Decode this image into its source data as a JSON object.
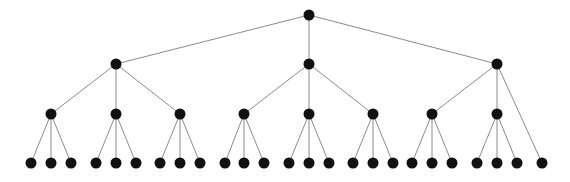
{
  "diagram": {
    "type": "tree",
    "width": 570,
    "height": 182,
    "colors": {
      "node": "#111111",
      "edge": "#8a8a8a",
      "background": "#ffffff"
    },
    "node_radius": 5.5,
    "nodes": [
      {
        "id": "r",
        "x": 309,
        "y": 15,
        "level": 0
      },
      {
        "id": "a",
        "x": 116,
        "y": 64,
        "level": 1,
        "parent": "r"
      },
      {
        "id": "b",
        "x": 309,
        "y": 64,
        "level": 1,
        "parent": "r"
      },
      {
        "id": "c",
        "x": 497,
        "y": 64,
        "level": 1,
        "parent": "r"
      },
      {
        "id": "a1",
        "x": 51,
        "y": 114,
        "level": 2,
        "parent": "a"
      },
      {
        "id": "a2",
        "x": 116,
        "y": 114,
        "level": 2,
        "parent": "a"
      },
      {
        "id": "a3",
        "x": 180,
        "y": 114,
        "level": 2,
        "parent": "a"
      },
      {
        "id": "b1",
        "x": 244,
        "y": 114,
        "level": 2,
        "parent": "b"
      },
      {
        "id": "b2",
        "x": 309,
        "y": 114,
        "level": 2,
        "parent": "b"
      },
      {
        "id": "b3",
        "x": 373,
        "y": 114,
        "level": 2,
        "parent": "b"
      },
      {
        "id": "c1",
        "x": 432,
        "y": 114,
        "level": 2,
        "parent": "c"
      },
      {
        "id": "c2",
        "x": 497,
        "y": 114,
        "level": 2,
        "parent": "c"
      },
      {
        "id": "a1x",
        "x": 31,
        "y": 163,
        "level": 3,
        "parent": "a1"
      },
      {
        "id": "a1y",
        "x": 51,
        "y": 163,
        "level": 3,
        "parent": "a1"
      },
      {
        "id": "a1z",
        "x": 71,
        "y": 163,
        "level": 3,
        "parent": "a1"
      },
      {
        "id": "a2x",
        "x": 96,
        "y": 163,
        "level": 3,
        "parent": "a2"
      },
      {
        "id": "a2y",
        "x": 116,
        "y": 163,
        "level": 3,
        "parent": "a2"
      },
      {
        "id": "a2z",
        "x": 136,
        "y": 163,
        "level": 3,
        "parent": "a2"
      },
      {
        "id": "a3x",
        "x": 160,
        "y": 163,
        "level": 3,
        "parent": "a3"
      },
      {
        "id": "a3y",
        "x": 180,
        "y": 163,
        "level": 3,
        "parent": "a3"
      },
      {
        "id": "a3z",
        "x": 200,
        "y": 163,
        "level": 3,
        "parent": "a3"
      },
      {
        "id": "b1x",
        "x": 225,
        "y": 163,
        "level": 3,
        "parent": "b1"
      },
      {
        "id": "b1y",
        "x": 244,
        "y": 163,
        "level": 3,
        "parent": "b1"
      },
      {
        "id": "b1z",
        "x": 264,
        "y": 163,
        "level": 3,
        "parent": "b1"
      },
      {
        "id": "b2x",
        "x": 289,
        "y": 163,
        "level": 3,
        "parent": "b2"
      },
      {
        "id": "b2y",
        "x": 309,
        "y": 163,
        "level": 3,
        "parent": "b2"
      },
      {
        "id": "b2z",
        "x": 329,
        "y": 163,
        "level": 3,
        "parent": "b2"
      },
      {
        "id": "b3x",
        "x": 353,
        "y": 163,
        "level": 3,
        "parent": "b3"
      },
      {
        "id": "b3y",
        "x": 373,
        "y": 163,
        "level": 3,
        "parent": "b3"
      },
      {
        "id": "b3z",
        "x": 393,
        "y": 163,
        "level": 3,
        "parent": "b3"
      },
      {
        "id": "c1x",
        "x": 412,
        "y": 163,
        "level": 3,
        "parent": "c1"
      },
      {
        "id": "c1y",
        "x": 432,
        "y": 163,
        "level": 3,
        "parent": "c1"
      },
      {
        "id": "c1z",
        "x": 452,
        "y": 163,
        "level": 3,
        "parent": "c1"
      },
      {
        "id": "c2x",
        "x": 477,
        "y": 163,
        "level": 3,
        "parent": "c2"
      },
      {
        "id": "c2y",
        "x": 497,
        "y": 163,
        "level": 3,
        "parent": "c2"
      },
      {
        "id": "c2z",
        "x": 517,
        "y": 163,
        "level": 3,
        "parent": "c2"
      },
      {
        "id": "c4",
        "x": 542,
        "y": 163,
        "level": 3,
        "parent": "c"
      }
    ]
  }
}
